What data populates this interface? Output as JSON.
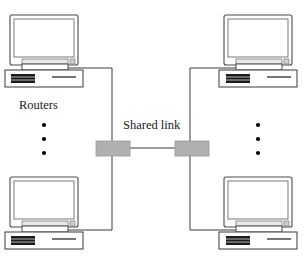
{
  "diagram": {
    "type": "network-topology",
    "title_visible": false,
    "background_color": "#ffffff",
    "line_color": "#3a3a3a",
    "device_fill": "#ffffff",
    "device_stroke": "#4a4a4a",
    "drive_bay_color": "#1a1a1a",
    "connector_fill": "#b0b0b0",
    "connector_stroke": "#9a9a9a",
    "dot_color": "#000000"
  },
  "labels": {
    "routers": "Routers",
    "shared_link": "Shared link"
  },
  "left_group": {
    "name": "Routers",
    "ellipsis_dots": 3,
    "computers": [
      {
        "id": "left-top",
        "position": "top-left",
        "drive_bay_side": "left"
      },
      {
        "id": "left-bottom",
        "position": "bottom-left",
        "drive_bay_side": "left"
      }
    ],
    "bus_line_x": 112
  },
  "right_group": {
    "name": "",
    "ellipsis_dots": 3,
    "computers": [
      {
        "id": "right-top",
        "position": "top-right",
        "drive_bay_side": "left"
      },
      {
        "id": "right-bottom",
        "position": "bottom-right",
        "drive_bay_side": "left"
      }
    ],
    "bus_line_x": 190
  },
  "shared_link": {
    "label": "Shared link",
    "left_connector": {
      "x": 96,
      "y": 141,
      "width": 34,
      "height": 15
    },
    "right_connector": {
      "x": 175,
      "y": 141,
      "width": 34,
      "height": 15
    },
    "link_line": {
      "x1": 130,
      "y1": 148,
      "x2": 175,
      "y2": 148
    }
  }
}
